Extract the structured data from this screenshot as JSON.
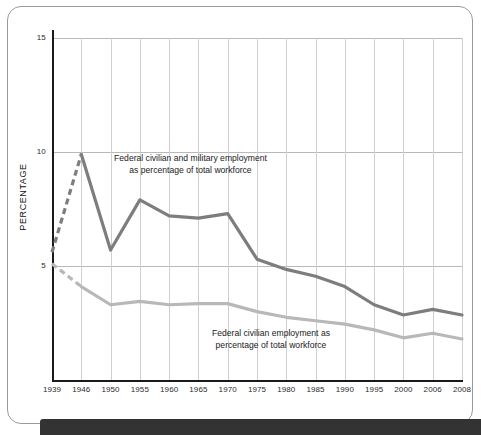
{
  "chart_data": {
    "type": "line",
    "title": "",
    "xlabel": "",
    "ylabel": "PERCENTAGE",
    "ylim": [
      0,
      15.6
    ],
    "xlim": [
      1939,
      2008
    ],
    "grid": true,
    "legend_position": "inline-annotations",
    "y_ticks": [
      "15",
      "10",
      "5"
    ],
    "y_tick_values": [
      15,
      10,
      5
    ],
    "categories": [
      "1939",
      "1946",
      "1950",
      "1955",
      "1960",
      "1965",
      "1970",
      "1975",
      "1980",
      "1985",
      "1990",
      "1995",
      "2000",
      "2006",
      "2008"
    ],
    "x": [
      1939,
      1946,
      1950,
      1955,
      1960,
      1965,
      1970,
      1975,
      1980,
      1985,
      1990,
      1995,
      2000,
      2006,
      2008
    ],
    "series": [
      {
        "name": "Federal civilian and military employment as percentage of total workforce",
        "color": "#7d7d7d",
        "values": [
          5.6,
          9.9,
          5.7,
          7.9,
          7.2,
          7.1,
          7.3,
          5.3,
          4.85,
          4.55,
          4.1,
          3.3,
          2.85,
          3.1,
          2.85
        ],
        "dashed_from_index": 0,
        "dashed_to_index": 1
      },
      {
        "name": "Federal civilian employment as percentage of total workforce",
        "color": "#b8b8b8",
        "values": [
          5.1,
          4.1,
          3.3,
          3.45,
          3.3,
          3.35,
          3.35,
          3.0,
          2.75,
          2.6,
          2.45,
          2.2,
          1.85,
          2.05,
          1.8
        ],
        "dashed_from_index": 0,
        "dashed_to_index": 1
      }
    ],
    "annotations": [
      {
        "id": "note-total",
        "text": "Federal civilian and military employment\nas percentage of total workforce"
      },
      {
        "id": "note-civilian",
        "text": "Federal civilian employment as\npercentage of total workforce"
      }
    ]
  },
  "axis": {
    "y_title": "PERCENTAGE",
    "y_labels": [
      "15",
      "10",
      "5"
    ],
    "x_labels": [
      "1939",
      "1946",
      "1950",
      "1955",
      "1960",
      "1965",
      "1970",
      "1975",
      "1980",
      "1985",
      "1990",
      "1995",
      "2000",
      "2006",
      "2008"
    ]
  },
  "colors": {
    "series_total": "#7d7d7d",
    "series_civilian": "#b8b8b8",
    "gridline": "#cfcfcf",
    "axis": "#1a1a1a",
    "frame": "#9a9a9a",
    "footer": "#333333",
    "background": "#ffffff"
  }
}
